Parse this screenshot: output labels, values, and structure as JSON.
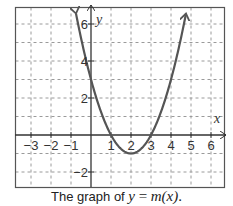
{
  "chart_data": {
    "type": "line",
    "title": "",
    "caption": {
      "prefix": "The graph of",
      "lhs": "y",
      "eq": "=",
      "rhs": "m(x)",
      "suffix": "."
    },
    "xlabel": "x",
    "ylabel": "y",
    "xlim": [
      -3.8,
      6.7
    ],
    "ylim": [
      -2.8,
      6.9
    ],
    "grid": true,
    "grid_style": "dashed",
    "x_ticks": [
      -3,
      -2,
      -1,
      1,
      2,
      3,
      4,
      5,
      6
    ],
    "x_tick_labels": [
      "−3",
      "−2",
      "−1",
      "1",
      "2",
      "3",
      "4",
      "5",
      "6"
    ],
    "y_ticks": [
      -2,
      2,
      4,
      6
    ],
    "y_tick_labels": [
      "−2",
      "2",
      "4",
      "6"
    ],
    "series": [
      {
        "name": "m(x)",
        "function": "x^2 - 4x + 3",
        "x_range": [
          -0.75,
          4.75
        ],
        "arrows_at_ends": true,
        "key_points": [
          {
            "x": -0.75,
            "y": 6.5625
          },
          {
            "x": 0,
            "y": 3
          },
          {
            "x": 1,
            "y": 0
          },
          {
            "x": 2,
            "y": -1
          },
          {
            "x": 3,
            "y": 0
          },
          {
            "x": 4,
            "y": 3
          },
          {
            "x": 4.75,
            "y": 6.5625
          }
        ]
      }
    ],
    "colors": {
      "curve": "#555555",
      "axes": "#333333",
      "grid": "#9a9a9a",
      "frame": "#555555"
    }
  }
}
